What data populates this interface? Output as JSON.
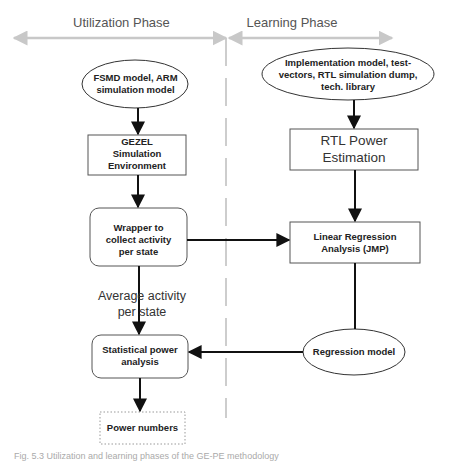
{
  "phases": {
    "utilization": "Utilization Phase",
    "learning": "Learning Phase"
  },
  "nodes": {
    "fsmd": {
      "line1": "FSMD model, ARM",
      "line2": "simulation model",
      "shape": "ellipse"
    },
    "gezel": {
      "line1": "GEZEL",
      "line2": "Simulation",
      "line3": "Environment",
      "shape": "rectangle"
    },
    "wrapper": {
      "line1": "Wrapper to",
      "line2": "collect activity",
      "line3": "per state",
      "shape": "rounded-rectangle"
    },
    "statistical": {
      "line1": "Statistical power",
      "line2": "analysis",
      "shape": "rounded-rectangle"
    },
    "power_numbers": {
      "label": "Power numbers",
      "shape": "dotted-rectangle"
    },
    "impl_inputs": {
      "line1": "Implementation model, test-",
      "line2": "vectors, RTL simulation dump,",
      "line3": "tech. library",
      "shape": "ellipse"
    },
    "rtl_power": {
      "line1": "RTL Power",
      "line2": "Estimation",
      "shape": "rectangle"
    },
    "linear_regression": {
      "line1": "Linear Regression",
      "line2": "Analysis (JMP)",
      "shape": "rectangle"
    },
    "regression_model": {
      "label": "Regression model",
      "shape": "ellipse"
    }
  },
  "edge_labels": {
    "average_activity_line1": "Average activity",
    "average_activity_line2": "per state"
  },
  "edges": [
    {
      "from": "fsmd",
      "to": "gezel"
    },
    {
      "from": "gezel",
      "to": "wrapper"
    },
    {
      "from": "wrapper",
      "to": "linear_regression"
    },
    {
      "from": "wrapper",
      "to": "statistical",
      "label": "Average activity per state"
    },
    {
      "from": "impl_inputs",
      "to": "rtl_power"
    },
    {
      "from": "rtl_power",
      "to": "linear_regression"
    },
    {
      "from": "linear_regression",
      "to": "regression_model"
    },
    {
      "from": "regression_model",
      "to": "statistical"
    },
    {
      "from": "statistical",
      "to": "power_numbers"
    }
  ],
  "caption": "Fig. 5.3 Utilization and learning phases of the GE-PE methodology",
  "colors": {
    "phase_arrow": "#c8c8c8",
    "divider": "#c8c8c8",
    "stroke": "#222222"
  }
}
